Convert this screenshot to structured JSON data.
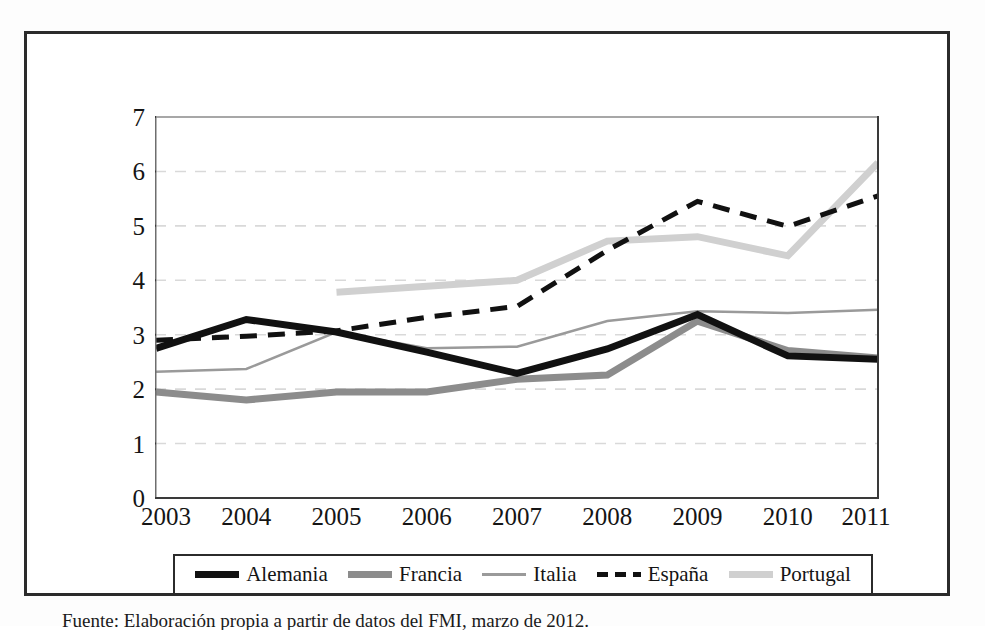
{
  "figure": {
    "caption": "Fuente: Elaboración propia a partir de datos del FMI, marzo de 2012."
  },
  "legend": {
    "position": "bottom",
    "items": [
      {
        "label": "Alemania",
        "color": "#111111",
        "style": "solid",
        "width": 7
      },
      {
        "label": "Francia",
        "color": "#8c8c8c",
        "style": "solid",
        "width": 7
      },
      {
        "label": "Italia",
        "color": "#9a9a9a",
        "style": "solid",
        "width": 2.5
      },
      {
        "label": "España",
        "color": "#111111",
        "style": "dashed",
        "width": 5
      },
      {
        "label": "Portugal",
        "color": "#d0d0d0",
        "style": "solid",
        "width": 7
      }
    ]
  },
  "chart_data": {
    "type": "line",
    "title": "",
    "xlabel": "",
    "ylabel": "",
    "categories": [
      2003,
      2004,
      2005,
      2006,
      2007,
      2008,
      2009,
      2010,
      2011
    ],
    "ylim": [
      0,
      7
    ],
    "yticks": [
      0,
      1,
      2,
      3,
      4,
      5,
      6,
      7
    ],
    "grid": "horizontal-dashed",
    "series": [
      {
        "name": "Alemania",
        "values": [
          2.75,
          3.28,
          3.05,
          2.68,
          2.29,
          2.74,
          3.37,
          2.61,
          2.55
        ]
      },
      {
        "name": "Francia",
        "values": [
          1.95,
          1.8,
          1.95,
          1.95,
          2.18,
          2.26,
          3.25,
          2.71,
          2.57
        ]
      },
      {
        "name": "Italia",
        "values": [
          2.32,
          2.37,
          3.05,
          2.75,
          2.78,
          3.25,
          3.43,
          3.4,
          3.46
        ]
      },
      {
        "name": "España",
        "values": [
          2.9,
          2.97,
          3.07,
          3.32,
          3.52,
          4.55,
          5.45,
          4.99,
          5.55
        ]
      },
      {
        "name": "Portugal",
        "values": [
          null,
          null,
          3.78,
          3.89,
          4.0,
          4.72,
          4.8,
          4.45,
          6.16
        ]
      }
    ]
  }
}
